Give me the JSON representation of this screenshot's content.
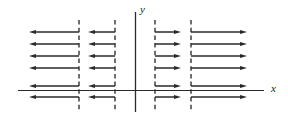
{
  "figure": {
    "type": "vector-field",
    "width": 288,
    "height": 120,
    "background": "#ffffff",
    "stroke_color": "#2a2a2a",
    "dash_color": "#333333"
  },
  "axes": {
    "x_axis": {
      "label": "x",
      "label_x": 271,
      "label_y": 92,
      "y": 90.5,
      "x_start": 18,
      "x_end": 264,
      "stroke_width": 1.1
    },
    "y_axis": {
      "label": "y",
      "label_x": 140,
      "label_y": 13,
      "x": 135.5,
      "y_start": 12,
      "y_end": 112,
      "stroke_width": 1.3
    }
  },
  "dashed_lines": [
    {
      "name": "dashed-line-1",
      "x": 79,
      "y_top": 20,
      "y_bottom": 112
    },
    {
      "name": "dashed-line-2",
      "x": 115,
      "y_top": 20,
      "y_bottom": 112
    },
    {
      "name": "dashed-line-3",
      "x": 155,
      "y_top": 20,
      "y_bottom": 112
    },
    {
      "name": "dashed-line-4",
      "x": 191,
      "y_top": 20,
      "y_bottom": 112
    }
  ],
  "row_y": [
    32,
    44,
    56,
    68,
    86,
    97
  ],
  "arrow_groups": [
    {
      "name": "far-left-group",
      "direction": "left",
      "tail_x": 79,
      "head_x": 29,
      "count": 6
    },
    {
      "name": "inner-left-group",
      "direction": "left",
      "tail_x": 115,
      "head_x": 88,
      "count": 6
    },
    {
      "name": "inner-right-group",
      "direction": "right",
      "tail_x": 155,
      "head_x": 181,
      "count": 6
    },
    {
      "name": "far-right-group",
      "direction": "right",
      "tail_x": 191,
      "head_x": 247,
      "count": 6
    }
  ],
  "chart_data": {
    "type": "scatter",
    "title": "",
    "xlabel": "x",
    "ylabel": "y",
    "grid": false,
    "legend": null,
    "dashed_vertical_lines_px": [
      79,
      115,
      155,
      191
    ],
    "arrow_rows_px": [
      32,
      44,
      56,
      68,
      86,
      97
    ],
    "series": [
      {
        "name": "far-left-arrows",
        "direction": "negative-x",
        "x_from_px": 79,
        "x_to_px": 29,
        "rows": 6
      },
      {
        "name": "inner-left-arrows",
        "direction": "negative-x",
        "x_from_px": 115,
        "x_to_px": 88,
        "rows": 6
      },
      {
        "name": "inner-right-arrows",
        "direction": "positive-x",
        "x_from_px": 155,
        "x_to_px": 181,
        "rows": 6
      },
      {
        "name": "far-right-arrows",
        "direction": "positive-x",
        "x_from_px": 191,
        "x_to_px": 247,
        "rows": 6
      }
    ]
  }
}
